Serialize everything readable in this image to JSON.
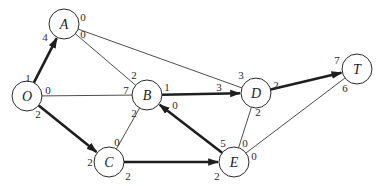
{
  "diagram": {
    "type": "flow-network",
    "colors": {
      "background": "#ffffff",
      "line": "#2b2b2b",
      "flow_line": "#1e1e1e"
    },
    "nodes": [
      {
        "id": "O",
        "label": "O",
        "x": 27,
        "y": 96
      },
      {
        "id": "A",
        "label": "A",
        "x": 64,
        "y": 24
      },
      {
        "id": "B",
        "label": "B",
        "x": 147,
        "y": 95
      },
      {
        "id": "C",
        "label": "C",
        "x": 109,
        "y": 162
      },
      {
        "id": "D",
        "label": "D",
        "x": 256,
        "y": 93
      },
      {
        "id": "E",
        "label": "E",
        "x": 234,
        "y": 162
      },
      {
        "id": "T",
        "label": "T",
        "x": 357,
        "y": 69
      }
    ],
    "edges": [
      {
        "from": "O",
        "to": "A",
        "flow": true,
        "from_label": "1",
        "to_label": "4",
        "fl_pos": [
          28,
          78
        ],
        "tl_pos": [
          45,
          37
        ]
      },
      {
        "from": "O",
        "to": "B",
        "flow": false,
        "from_label": "0",
        "to_label": "7",
        "fl_pos": [
          48,
          90
        ],
        "tl_pos": [
          126,
          90
        ]
      },
      {
        "from": "O",
        "to": "C",
        "flow": true,
        "from_label": "2",
        "to_label": "2",
        "fl_pos": [
          38,
          114
        ],
        "tl_pos": [
          90,
          162
        ]
      },
      {
        "from": "A",
        "to": "B",
        "flow": false,
        "from_label": "0",
        "to_label": "2",
        "fl_pos": [
          83,
          34
        ],
        "tl_pos": [
          134,
          75
        ]
      },
      {
        "from": "A",
        "to": "D",
        "flow": false,
        "from_label": "0",
        "to_label": "3",
        "fl_pos": [
          83,
          17
        ],
        "tl_pos": [
          241,
          75
        ]
      },
      {
        "from": "B",
        "to": "D",
        "flow": true,
        "from_label": "1",
        "to_label": "3",
        "fl_pos": [
          167,
          87
        ],
        "tl_pos": [
          219,
          87
        ]
      },
      {
        "from": "B",
        "to": "C",
        "flow": false,
        "from_label": "2",
        "to_label": "0",
        "fl_pos": [
          134,
          113
        ],
        "tl_pos": [
          117,
          142
        ]
      },
      {
        "from": "E",
        "to": "B",
        "flow": true,
        "from_label": "5",
        "to_label": "0",
        "fl_pos": [
          223,
          143
        ],
        "tl_pos": [
          175,
          105
        ]
      },
      {
        "from": "C",
        "to": "E",
        "flow": true,
        "from_label": "2",
        "to_label": "2",
        "fl_pos": [
          128,
          176
        ],
        "tl_pos": [
          217,
          176
        ]
      },
      {
        "from": "D",
        "to": "E",
        "flow": false,
        "from_label": "2",
        "to_label": "0",
        "fl_pos": [
          258,
          112
        ],
        "tl_pos": [
          245,
          143
        ]
      },
      {
        "from": "D",
        "to": "T",
        "flow": true,
        "from_label": "2",
        "to_label": "7",
        "fl_pos": [
          276,
          85
        ],
        "tl_pos": [
          337,
          60
        ]
      },
      {
        "from": "E",
        "to": "T",
        "flow": false,
        "from_label": "0",
        "to_label": "6",
        "fl_pos": [
          254,
          156
        ],
        "tl_pos": [
          345,
          88
        ]
      }
    ]
  }
}
